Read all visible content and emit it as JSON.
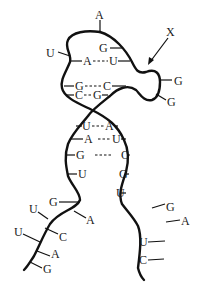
{
  "diagram": {
    "type": "RNA secondary structure (hairpin loop)",
    "pointer_label": "X",
    "loop_top_base": "A",
    "loop_left_base": "U",
    "loop_inner_base": "G",
    "bulge_bases": [
      "G",
      "G"
    ],
    "upper_pairs": [
      {
        "left": "A",
        "right": "U"
      },
      {
        "left": "G",
        "right": "C"
      },
      {
        "left": "C",
        "right": "G"
      }
    ],
    "lower_pairs": [
      {
        "left": "U",
        "right": "A"
      },
      {
        "left": "A",
        "right": "U"
      },
      {
        "left": "G",
        "right": "C"
      }
    ],
    "left_unpaired": [
      "U",
      "G",
      "A",
      "U",
      "C",
      "U",
      "A",
      "G"
    ],
    "right_unpaired": [
      "G",
      "U",
      "G",
      "A",
      "U",
      "C"
    ]
  }
}
